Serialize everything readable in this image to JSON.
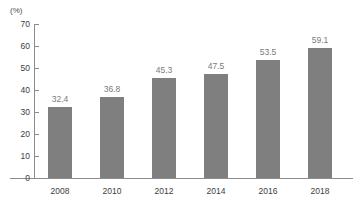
{
  "chart_data": {
    "type": "bar",
    "title": "",
    "subtitle": "",
    "xlabel": "",
    "ylabel": "",
    "unit_label": "(%)",
    "categories": [
      "2008",
      "2010",
      "2012",
      "2014",
      "2016",
      "2018"
    ],
    "values": [
      32.4,
      36.8,
      45.3,
      47.5,
      53.5,
      59.1
    ],
    "value_labels": [
      "32.4",
      "36.8",
      "45.3",
      "47.5",
      "53.5",
      "59.1"
    ],
    "ylim": [
      0,
      70
    ],
    "ytick_values": [
      0,
      10,
      20,
      30,
      40,
      50,
      60,
      70
    ],
    "ytick_labels": [
      "0",
      "10",
      "20",
      "30",
      "40",
      "50",
      "60",
      "70"
    ],
    "grid": false,
    "legend": null,
    "legend_position": "none",
    "bar_color": "#7f7f7f",
    "axis_color": "#8c8c8c",
    "value_label_color": "#7a7a7a",
    "tick_label_color": "#3d3d3d",
    "background_color": "#ffffff"
  }
}
